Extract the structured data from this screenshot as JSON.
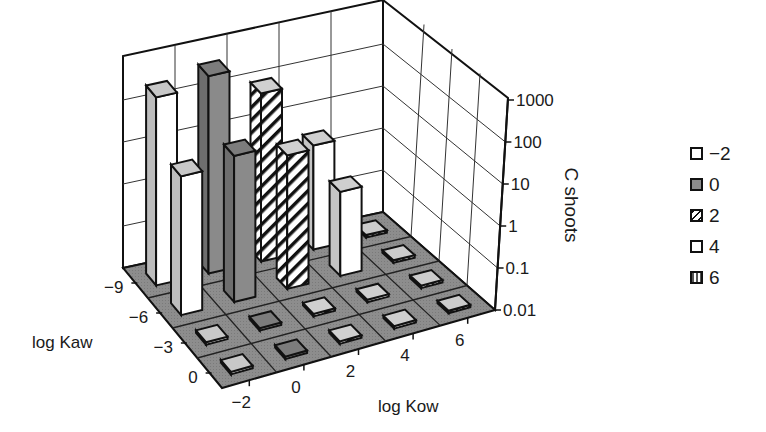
{
  "chart_data": {
    "type": "bar3d",
    "title": "",
    "xlabel": "log Kow",
    "ylabel": "log Kaw",
    "zlabel": "C shoots",
    "x_ticks": [
      "-2",
      "0",
      "2",
      "4",
      "6"
    ],
    "y_ticks": [
      "-9",
      "-6",
      "-3",
      "0"
    ],
    "z_ticks": [
      "0.01",
      "0.1",
      "1",
      "10",
      "100",
      "1000"
    ],
    "z_scale": "log",
    "zlim": [
      0.01,
      1000
    ],
    "legend_position": "right",
    "legend": [
      {
        "label": "−2",
        "pattern": "white"
      },
      {
        "label": "0",
        "pattern": "gray"
      },
      {
        "label": "2",
        "pattern": "diagonal-hatch"
      },
      {
        "label": "4",
        "pattern": "white"
      },
      {
        "label": "6",
        "pattern": "vertical-stripes"
      }
    ],
    "series": [
      {
        "name": "-2",
        "log_kow": -2,
        "values_by_log_kaw": {
          "-9": 300,
          "-6": 20,
          "-3": 0.01,
          "0": 0.01
        }
      },
      {
        "name": "0",
        "log_kow": 0,
        "values_by_log_kaw": {
          "-9": 500,
          "-6": 30,
          "-3": 0.01,
          "0": 0.01
        }
      },
      {
        "name": "2",
        "log_kow": 2,
        "values_by_log_kaw": {
          "-9": 100,
          "-6": 15,
          "-3": 0.01,
          "0": 0.01
        }
      },
      {
        "name": "4",
        "log_kow": 4,
        "values_by_log_kaw": {
          "-9": 3,
          "-6": 1,
          "-3": 0.01,
          "0": 0.01
        }
      },
      {
        "name": "6",
        "log_kow": 6,
        "values_by_log_kaw": {
          "-9": 0.01,
          "-6": 0.01,
          "-3": 0.01,
          "0": 0.01
        }
      }
    ]
  },
  "labels": {
    "xlabel": "log Kow",
    "ylabel": "log Kaw",
    "zlabel": "C shoots",
    "x_ticks": [
      "−2",
      "0",
      "2",
      "4",
      "6"
    ],
    "y_ticks": [
      "−9",
      "−6",
      "−3",
      "0"
    ],
    "z_ticks": [
      "0.01",
      "0.1",
      "1",
      "10",
      "100",
      "1000"
    ]
  },
  "legend": [
    {
      "label": "−2"
    },
    {
      "label": "0"
    },
    {
      "label": "2"
    },
    {
      "label": "4"
    },
    {
      "label": "6"
    }
  ]
}
